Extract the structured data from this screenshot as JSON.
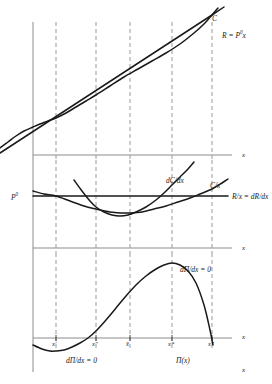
{
  "chart_data": {
    "type": "line",
    "title": "",
    "panels": [
      {
        "name": "total-curves-panel",
        "ylabel": "",
        "xlabel": "x",
        "series": [
          {
            "name": "C",
            "label": "C",
            "description": "total cost curve, S-shaped, starts above origin",
            "points": [
              [
                0,
                148
              ],
              [
                8,
                142
              ],
              [
                16,
                136
              ],
              [
                24,
                131
              ],
              [
                33,
                127
              ],
              [
                40,
                124
              ],
              [
                48,
                121
              ],
              [
                56,
                118
              ],
              [
                66,
                113
              ],
              [
                76,
                107
              ],
              [
                86,
                101
              ],
              [
                96,
                95
              ],
              [
                110,
                86
              ],
              [
                124,
                77
              ],
              [
                138,
                69
              ],
              [
                152,
                61
              ],
              [
                166,
                53
              ],
              [
                180,
                44
              ],
              [
                194,
                33
              ],
              [
                204,
                24
              ],
              [
                212,
                15
              ],
              [
                218,
                8
              ]
            ]
          },
          {
            "name": "R",
            "label": "R = P⁰x",
            "description": "revenue straight line through origin",
            "points": [
              [
                0,
                153
              ],
              [
                212,
                15
              ],
              [
                224,
                7
              ]
            ]
          }
        ]
      },
      {
        "name": "average-marginal-panel",
        "xlabel": "x",
        "series": [
          {
            "name": "C/x",
            "label": "C/x",
            "description": "average cost, flat U-curve, minimum at x-bar",
            "points": [
              [
                33,
                191
              ],
              [
                44,
                194
              ],
              [
                56,
                196
              ],
              [
                70,
                201
              ],
              [
                84,
                206
              ],
              [
                96,
                209
              ],
              [
                110,
                212
              ],
              [
                120,
                213
              ],
              [
                130,
                213
              ],
              [
                142,
                212
              ],
              [
                154,
                209
              ],
              [
                166,
                206
              ],
              [
                178,
                202
              ],
              [
                190,
                198
              ],
              [
                200,
                194
              ],
              [
                212,
                189
              ],
              [
                222,
                183
              ],
              [
                228,
                179
              ]
            ]
          },
          {
            "name": "dC/dx",
            "label": "dC/dx",
            "description": "marginal cost, steep U-curve, minimum near x-double-prime, crosses P0 at x-star",
            "points": [
              [
                74,
                180
              ],
              [
                82,
                191
              ],
              [
                90,
                201
              ],
              [
                96,
                207
              ],
              [
                104,
                212
              ],
              [
                112,
                215
              ],
              [
                120,
                216
              ],
              [
                128,
                215
              ],
              [
                136,
                212
              ],
              [
                146,
                207
              ],
              [
                156,
                200
              ],
              [
                164,
                193
              ],
              [
                172,
                185
              ],
              [
                180,
                177
              ],
              [
                188,
                169
              ],
              [
                194,
                162
              ]
            ]
          },
          {
            "name": "R/x = dR/dx",
            "label": "R/x = dR/dx",
            "description": "horizontal price line at P0",
            "points": [
              [
                33,
                196
              ],
              [
                228,
                196
              ]
            ]
          }
        ]
      },
      {
        "name": "profit-panel",
        "xlabel": "x",
        "series": [
          {
            "name": "Π(x)",
            "label": "Π(x)",
            "description": "profit curve, minimum at x-prime below axis, zero at x-double-prime, maximum at x-star, returns to zero at x-triple-prime",
            "points": [
              [
                33,
                345
              ],
              [
                42,
                349
              ],
              [
                50,
                351
              ],
              [
                56,
                351
              ],
              [
                64,
                350
              ],
              [
                72,
                347
              ],
              [
                80,
                343
              ],
              [
                88,
                338
              ],
              [
                96,
                331
              ],
              [
                106,
                320
              ],
              [
                116,
                308
              ],
              [
                126,
                296
              ],
              [
                136,
                285
              ],
              [
                146,
                276
              ],
              [
                156,
                269
              ],
              [
                164,
                265
              ],
              [
                172,
                263
              ],
              [
                180,
                265
              ],
              [
                188,
                271
              ],
              [
                196,
                283
              ],
              [
                204,
                305
              ],
              [
                210,
                330
              ],
              [
                213,
                345
              ]
            ]
          }
        ]
      }
    ],
    "vertical_gridlines": [
      {
        "x": 56,
        "label": "x′"
      },
      {
        "x": 96,
        "label": "x″"
      },
      {
        "x": 130,
        "label": "x̄"
      },
      {
        "x": 172,
        "label": "x*"
      },
      {
        "x": 212,
        "label": "x‴"
      }
    ],
    "annotations": [
      {
        "name": "cost-curve-label",
        "text": "C"
      },
      {
        "name": "revenue-line-label",
        "text": "R = P⁰x"
      },
      {
        "name": "marginal-cost-label",
        "text": "dC/dx"
      },
      {
        "name": "average-cost-label",
        "text": "C/x"
      },
      {
        "name": "price-line-label",
        "text": "R/x = dR/dx"
      },
      {
        "name": "price-level-label",
        "text": "P⁰"
      },
      {
        "name": "profit-max-label",
        "text": "dΠ/dx = 0"
      },
      {
        "name": "profit-min-label",
        "text": "dΠ/dx = 0"
      },
      {
        "name": "profit-curve-label",
        "text": "Π(x)"
      }
    ]
  },
  "labels": {
    "cost_curve": "C",
    "revenue_line": "R = P",
    "revenue_line_sup": "0",
    "revenue_line_tail": "x",
    "marginal_cost": "dC/dx",
    "average_cost": "C/x",
    "price_line": "R/x = dR/dx",
    "price_level": "P",
    "price_level_sup": "0",
    "profit_max": "dΠ/dx = 0",
    "profit_min": "dΠ/dx = 0",
    "profit_curve": "Π(x)",
    "axis_x_top": "x",
    "axis_x_mid": "x",
    "axis_x_bottom": "x",
    "axis_x_extra": "x",
    "tick_x_prime": "x′",
    "tick_x_double_prime": "x″",
    "tick_x_bar": "x̄",
    "tick_x_star": "x*",
    "tick_x_triple_prime": "x‴"
  },
  "colors": {
    "curve": "#1a1a1a",
    "axis": "#8c8c8c",
    "grid": "#9a9a9a",
    "background": "#ffffff"
  }
}
